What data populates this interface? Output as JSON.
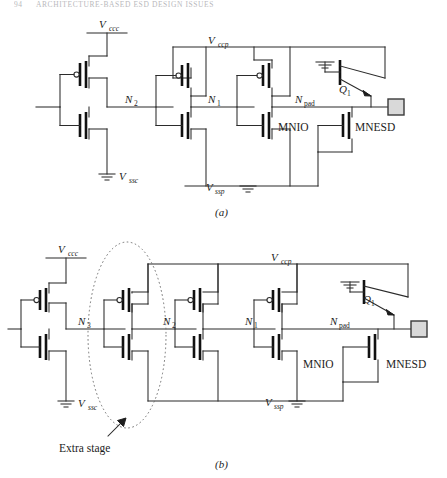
{
  "page_header": {
    "page_number": "94",
    "running_title": "ARCHITECTURE-BASED ESD DESIGN ISSUES"
  },
  "figure": {
    "panels": [
      {
        "caption": "(a)",
        "title": "Two-stage predriver output buffer with ESD devices",
        "supplies": [
          {
            "name": "vccc",
            "label": "V",
            "sub": "ccc"
          },
          {
            "name": "vccp",
            "label": "V",
            "sub": "ccp"
          },
          {
            "name": "vssc",
            "label": "V",
            "sub": "ssc"
          },
          {
            "name": "vssp",
            "label": "V",
            "sub": "ssp"
          }
        ],
        "nodes": [
          {
            "name": "n2",
            "label": "N",
            "sub": "2"
          },
          {
            "name": "n1",
            "label": "N",
            "sub": "1"
          },
          {
            "name": "npad",
            "label": "N",
            "sub": "pad"
          }
        ],
        "devices": [
          {
            "name": "mnio",
            "label": "MNIO"
          },
          {
            "name": "mnesd",
            "label": "MNESD"
          },
          {
            "name": "q1",
            "label": "Q",
            "sub": "1"
          }
        ],
        "pad": {
          "name": "bond-pad",
          "label": ""
        }
      },
      {
        "caption": "(b)",
        "title": "Three-stage predriver output buffer with extra stage",
        "supplies": [
          {
            "name": "vccc",
            "label": "V",
            "sub": "ccc"
          },
          {
            "name": "vccp",
            "label": "V",
            "sub": "ccp"
          },
          {
            "name": "vssc",
            "label": "V",
            "sub": "ssc"
          },
          {
            "name": "vssp",
            "label": "V",
            "sub": "ssp"
          }
        ],
        "nodes": [
          {
            "name": "n3",
            "label": "N",
            "sub": "3"
          },
          {
            "name": "n2",
            "label": "N",
            "sub": "2"
          },
          {
            "name": "n1",
            "label": "N",
            "sub": "1"
          },
          {
            "name": "npad",
            "label": "N",
            "sub": "pad"
          }
        ],
        "devices": [
          {
            "name": "mnio",
            "label": "MNIO"
          },
          {
            "name": "mnesd",
            "label": "MNESD"
          },
          {
            "name": "q1",
            "label": "Q",
            "sub": "1"
          }
        ],
        "annotation": {
          "name": "extra-stage",
          "label": "Extra stage"
        },
        "pad": {
          "name": "bond-pad",
          "label": ""
        }
      }
    ]
  },
  "colors": {
    "wire": "#2b2b2b",
    "gate": "#111111",
    "pad_fill": "#d9d9d9",
    "dotted_ellipse": "#6f6f6f",
    "header_text": "#b9b9bd"
  }
}
